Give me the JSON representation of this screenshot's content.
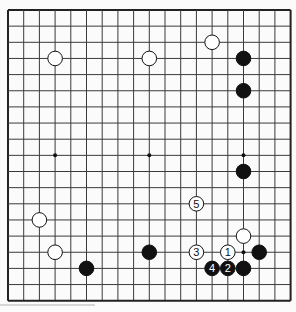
{
  "board": {
    "size": 19,
    "origin_x": 8,
    "origin_y": 10,
    "spacing_x": 15.7,
    "spacing_y": 16.15,
    "line_color": "#3a3a3a",
    "border_color": "#222222",
    "background": "#fbfbfb",
    "stone_radius": 7.3,
    "hoshi": [
      [
        3,
        9
      ],
      [
        9,
        9
      ],
      [
        15,
        9
      ],
      [
        15,
        15
      ]
    ],
    "stones": [
      {
        "col": 3,
        "row": 3,
        "color": "white",
        "label": ""
      },
      {
        "col": 9,
        "row": 3,
        "color": "white",
        "label": ""
      },
      {
        "col": 13,
        "row": 2,
        "color": "white",
        "label": ""
      },
      {
        "col": 15,
        "row": 3,
        "color": "black",
        "label": ""
      },
      {
        "col": 15,
        "row": 5,
        "color": "black",
        "label": ""
      },
      {
        "col": 15,
        "row": 10,
        "color": "black",
        "label": ""
      },
      {
        "col": 12,
        "row": 12,
        "color": "white",
        "label": "5"
      },
      {
        "col": 2,
        "row": 13,
        "color": "white",
        "label": ""
      },
      {
        "col": 15,
        "row": 14,
        "color": "white",
        "label": ""
      },
      {
        "col": 3,
        "row": 15,
        "color": "white",
        "label": ""
      },
      {
        "col": 9,
        "row": 15,
        "color": "black",
        "label": ""
      },
      {
        "col": 12,
        "row": 15,
        "color": "white",
        "label": "3"
      },
      {
        "col": 14,
        "row": 15,
        "color": "white",
        "label": "1"
      },
      {
        "col": 16,
        "row": 15,
        "color": "black",
        "label": ""
      },
      {
        "col": 5,
        "row": 16,
        "color": "black",
        "label": ""
      },
      {
        "col": 13,
        "row": 16,
        "color": "black",
        "label": "4"
      },
      {
        "col": 14,
        "row": 16,
        "color": "black",
        "label": "2"
      },
      {
        "col": 15,
        "row": 16,
        "color": "black",
        "label": ""
      }
    ]
  }
}
